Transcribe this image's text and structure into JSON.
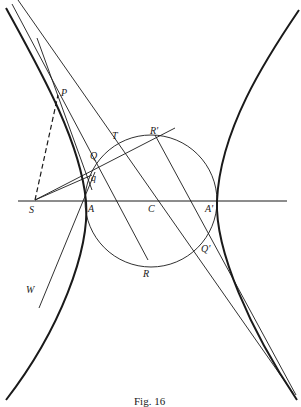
{
  "caption": "Fig. 16",
  "colors": {
    "ink": "#1a1a1a",
    "background": "#ffffff"
  },
  "labels": {
    "P": "P",
    "T": "T",
    "R_prime": "R'",
    "Q": "Q",
    "q": "q",
    "S": "S",
    "A": "A",
    "C": "C",
    "A_prime": "A'",
    "Q_prime": "Q'",
    "R": "R",
    "W": "W"
  }
}
